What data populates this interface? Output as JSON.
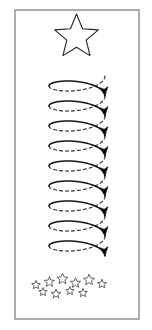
{
  "canvas": {
    "width": 152,
    "height": 330,
    "background_color": "#ffffff",
    "title": "Falling Star Spiral Illustration"
  },
  "frame": {
    "name": "border-rectangle",
    "x": 15,
    "y": 10,
    "width": 124,
    "height": 309,
    "stroke_color": "#8a8a8a",
    "stroke_width": 1.4,
    "fill": "none"
  },
  "big_star": {
    "label": "large-outline-star",
    "center_x": 76.5,
    "center_y": 37,
    "outer_radius": 23,
    "inner_radius": 10.2,
    "points": 5,
    "rotation_deg": -90,
    "stroke_color": "#222222",
    "stroke_width": 1.1,
    "fill": "none"
  },
  "spiral": {
    "label": "descending-helix-coil",
    "center_x": 77,
    "top_y": 76,
    "bottom_y": 256,
    "radius_x": 28,
    "radius_y": 9.5,
    "turns": 9,
    "direction": "counterclockwise-descending",
    "front_stroke": {
      "color": "#111111",
      "width": 1.5,
      "style": "solid"
    },
    "back_stroke": {
      "color": "#333333",
      "width": 1.2,
      "style": "dashed",
      "dash_array": "3 3"
    },
    "arrowhead": {
      "name": "filled-triangle-arrowhead",
      "fill_color": "#111111",
      "length": 9,
      "half_width": 4.2,
      "count": 9
    }
  },
  "star_cluster": {
    "label": "small-star-cluster",
    "count": 10,
    "stroke_color": "#555555",
    "stroke_width": 0.9,
    "fill": "none",
    "stars": [
      {
        "cx": 36,
        "cy": 285,
        "r": 4.6,
        "rot": -90
      },
      {
        "cx": 49.5,
        "cy": 282,
        "r": 5.4,
        "rot": -90
      },
      {
        "cx": 62.5,
        "cy": 279,
        "r": 5.8,
        "rot": -90
      },
      {
        "cx": 75.5,
        "cy": 283,
        "r": 5.4,
        "rot": -90
      },
      {
        "cx": 89,
        "cy": 280,
        "r": 5.8,
        "rot": -90
      },
      {
        "cx": 102,
        "cy": 284,
        "r": 4.8,
        "rot": -90
      },
      {
        "cx": 43,
        "cy": 292,
        "r": 4.4,
        "rot": -90
      },
      {
        "cx": 56,
        "cy": 294,
        "r": 5.0,
        "rot": -90
      },
      {
        "cx": 70,
        "cy": 291,
        "r": 4.4,
        "rot": -90
      },
      {
        "cx": 83,
        "cy": 293,
        "r": 4.6,
        "rot": -90
      }
    ]
  }
}
